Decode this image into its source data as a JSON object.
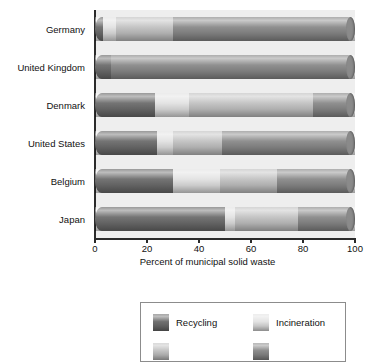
{
  "chart_data": {
    "type": "bar",
    "orientation": "horizontal",
    "stacked": true,
    "title": "",
    "xlabel": "Percent of municipal solid waste",
    "ylabel": "",
    "xlim": [
      0,
      100
    ],
    "xticks": [
      0,
      20,
      40,
      60,
      80,
      100
    ],
    "xtick_labels": [
      "0",
      "20",
      "40",
      "60",
      "80",
      "100"
    ],
    "grid": false,
    "legend_position": "bottom",
    "categories": [
      "Germany",
      "United Kingdom",
      "Denmark",
      "United States",
      "Belgium",
      "Japan"
    ],
    "series": [
      {
        "name": "Recycling",
        "color": "#6d6d6d",
        "values": [
          3,
          6,
          23,
          24,
          30,
          50
        ]
      },
      {
        "name": "Incineration",
        "color": "#e2e2e2",
        "values": [
          5,
          0,
          13,
          6,
          18,
          4
        ]
      },
      {
        "name": "Composting",
        "color": "#c2c2c2",
        "values": [
          22,
          0,
          48,
          19,
          22,
          24
        ]
      },
      {
        "name": "Landfill",
        "color": "#8a8a8a",
        "values": [
          70,
          94,
          16,
          51,
          30,
          22
        ]
      }
    ]
  },
  "axis": {
    "x_title": "Percent of municipal solid waste"
  },
  "legend": {
    "entries": [
      {
        "label": "Recycling",
        "color": "#6d6d6d"
      },
      {
        "label": "Incineration",
        "color": "#e2e2e2"
      },
      {
        "label": "",
        "color": "#c2c2c2"
      },
      {
        "label": "",
        "color": "#8a8a8a"
      }
    ]
  }
}
